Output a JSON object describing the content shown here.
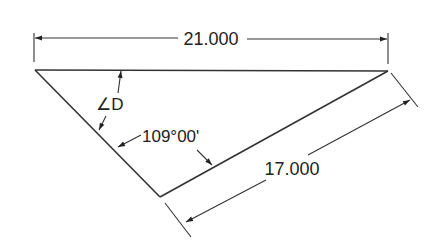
{
  "diagram": {
    "type": "dimensioned-triangle",
    "line_color": "#333333",
    "text_color": "#222222",
    "background": "#ffffff",
    "dimensions": {
      "top_length": "21.000",
      "side_length": "17.000",
      "included_angle": "109°00'",
      "unknown_angle": "∠D"
    },
    "vertices": {
      "top_left": [
        35,
        70
      ],
      "top_right": [
        388,
        71
      ],
      "bottom": [
        160,
        197
      ]
    }
  }
}
